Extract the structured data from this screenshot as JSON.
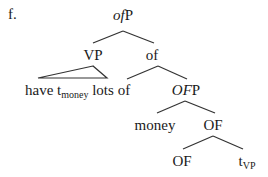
{
  "example_label": "f.",
  "tree": {
    "root": {
      "italic_part": "of",
      "plain_part": "P"
    },
    "level1": {
      "left": "VP",
      "right": "of"
    },
    "vp_triangle": {
      "word1": "have t",
      "trace_subscript": "money",
      "word2": " lots of"
    },
    "ofp": {
      "italic_part": "OF",
      "plain_part": "P"
    },
    "level3": {
      "left": "money",
      "right": "OF"
    },
    "level4": {
      "left": "OF",
      "trace": "t",
      "trace_subscript": "VP"
    }
  },
  "colors": {
    "ink": "#1a1a1a",
    "background": "#ffffff"
  }
}
